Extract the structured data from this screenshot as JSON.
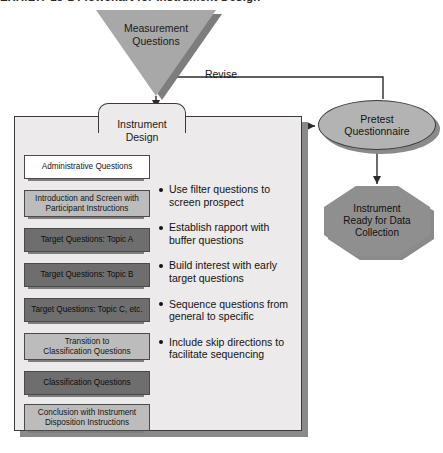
{
  "page": {
    "caption_cropped": "EXHIBIT 13-1  Flowchart for Instrument Design"
  },
  "diagram": {
    "start_node": {
      "label": "Measurement\nQuestions",
      "line1": "Measurement",
      "line2": "Questions",
      "shape": "inverted-triangle",
      "fill": "#a8a8a8"
    },
    "process_container": {
      "title_line1": "Instrument",
      "title_line2": "Design",
      "fill": "#eceaea"
    },
    "steps": [
      {
        "line1": "Administrative Questions",
        "line2": "",
        "tone": "white"
      },
      {
        "line1": "Introduction and Screen with",
        "line2": "Participant Instructions",
        "tone": "light"
      },
      {
        "line1": "Target Questions: Topic A",
        "line2": "",
        "tone": "dark"
      },
      {
        "line1": "Target Questions: Topic B",
        "line2": "",
        "tone": "dark"
      },
      {
        "line1": "Target Questions: Topic C, etc.",
        "line2": "",
        "tone": "dark"
      },
      {
        "line1": "Transition to",
        "line2": "Classification Questions",
        "tone": "light"
      },
      {
        "line1": "Classification Questions",
        "line2": "",
        "tone": "dark"
      },
      {
        "line1": "Conclusion with Instrument",
        "line2": "Disposition Instructions",
        "tone": "light"
      }
    ],
    "guidelines": [
      {
        "line1": "Use filter questions to",
        "line2": "screen prospect"
      },
      {
        "line1": "Establish rapport with",
        "line2": "buffer questions"
      },
      {
        "line1": "Build interest with early",
        "line2": "target questions"
      },
      {
        "line1": "Sequence questions from",
        "line2": "general to specific"
      },
      {
        "line1": "Include skip directions to",
        "line2": "facilitate sequencing"
      }
    ],
    "pretest_node": {
      "line1": "Pretest",
      "line2": "Questionnaire",
      "shape": "ellipse",
      "fill": "#b3b3b3"
    },
    "end_node": {
      "line1": "Instrument",
      "line2": "Ready for Data",
      "line3": "Collection",
      "shape": "octagon",
      "fill": "#8f8f8f"
    },
    "connectors": [
      {
        "name": "revise",
        "label": "Revise"
      },
      {
        "name": "design-to-pretest",
        "label": ""
      },
      {
        "name": "measurement-to-design",
        "label": ""
      },
      {
        "name": "pretest-to-ready",
        "label": ""
      }
    ]
  }
}
